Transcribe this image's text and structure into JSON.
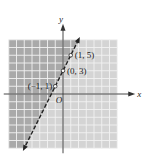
{
  "chart_data": {
    "type": "line",
    "title": "",
    "xlabel": "x",
    "ylabel": "y",
    "origin_label": "O",
    "xlim": [
      -7,
      7
    ],
    "ylim": [
      -7,
      7
    ],
    "grid": true,
    "line": {
      "equation": "y = 2x + 3",
      "slope": 2,
      "intercept": 3,
      "style": "dashed",
      "arrows": "both"
    },
    "shaded_region": "above-left of line (y > 2x + 3)",
    "points": [
      {
        "x": -1,
        "y": 1,
        "label": "(−1, 1)"
      },
      {
        "x": 0,
        "y": 3,
        "label": "(0, 3)"
      },
      {
        "x": 1,
        "y": 5,
        "label": "(1, 5)"
      }
    ],
    "colors": {
      "shaded": "#a9a9a9",
      "unshaded": "#d4d4d4",
      "grid": "#f2f2f2",
      "axis": "#333333",
      "line": "#222222"
    }
  }
}
